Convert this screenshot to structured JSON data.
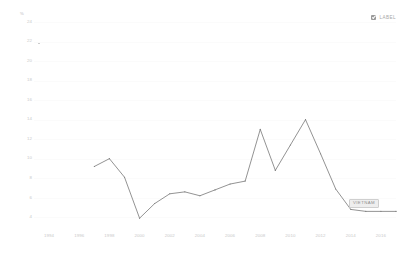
{
  "legend": {
    "checkbox_checked": true,
    "label": "LABEL",
    "checkbox_icon": "checkbox-checked-icon"
  },
  "series_label": {
    "text": "VIETNAM"
  },
  "chart_data": {
    "type": "line",
    "title": "",
    "subtitle": "",
    "xlabel": "",
    "ylabel": "%",
    "unit_symbol": "%",
    "grid": true,
    "legend_position": "top-right",
    "xlim": [
      1993,
      2017
    ],
    "ylim": [
      3,
      24
    ],
    "xticks": [
      "1994",
      "1996",
      "1998",
      "2000",
      "2002",
      "2004",
      "2006",
      "2008",
      "2010",
      "2012",
      "2014",
      "2016"
    ],
    "yticks": [
      "24",
      "22",
      "20",
      "18",
      "16",
      "14",
      "12",
      "10",
      "8",
      "6",
      "4"
    ],
    "series": [
      {
        "name": "VIETNAM",
        "color": "#6f6f6f",
        "x": [
          1997,
          1998,
          1999,
          2000,
          2001,
          2002,
          2003,
          2004,
          2005,
          2006,
          2007,
          2008,
          2009,
          2010,
          2011,
          2012,
          2013,
          2014,
          2015,
          2016,
          2017
        ],
        "values": [
          9.2,
          10.0,
          8.1,
          3.9,
          5.4,
          6.4,
          6.6,
          6.2,
          6.8,
          7.4,
          7.7,
          13.0,
          8.8,
          11.4,
          14.0,
          10.5,
          6.9,
          4.8,
          4.6,
          4.6,
          4.6
        ]
      }
    ]
  }
}
